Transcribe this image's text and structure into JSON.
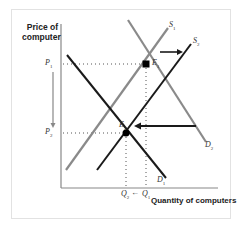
{
  "diagram": {
    "y_axis_label_line1": "Price of",
    "y_axis_label_line2": "computer",
    "x_axis_label": "Quantity of computers",
    "price_labels": [
      {
        "name": "P",
        "sub": "1"
      },
      {
        "name": "P",
        "sub": "2"
      }
    ],
    "quantity_labels": [
      {
        "name": "Q",
        "sub": "2"
      },
      {
        "name": "Q",
        "sub": "1"
      }
    ],
    "quantity_arrow": "←",
    "curves": [
      {
        "name": "S",
        "sub": "1",
        "color": "#8a8a8a"
      },
      {
        "name": "S",
        "sub": "2",
        "color": "#1a1a1a"
      },
      {
        "name": "D",
        "sub": "1",
        "color": "#1a1a1a"
      },
      {
        "name": "D",
        "sub": "2",
        "color": "#8a8a8a"
      }
    ],
    "equilibria": [
      {
        "name": "E",
        "sub": "1"
      },
      {
        "name": "E",
        "sub": "2"
      }
    ],
    "colors": {
      "dark_curve": "#1a1a1a",
      "light_curve": "#8a8a8a",
      "axis": "#888888",
      "frame": "#e2e2e2"
    }
  }
}
